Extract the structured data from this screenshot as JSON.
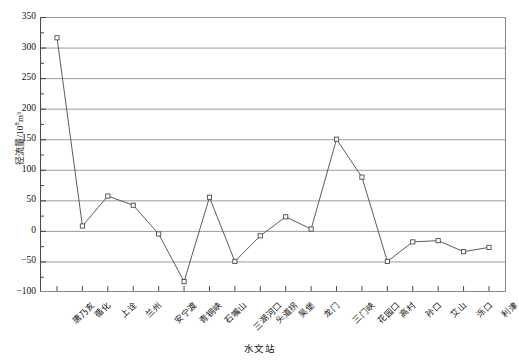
{
  "chart_data": {
    "type": "line",
    "title": "",
    "xlabel": "水文站",
    "ylabel": "径流量/10⁸m³",
    "ylabel_base": "径流量/10",
    "ylabel_exp": "8",
    "ylabel_unit": "m³",
    "ylim": [
      -100,
      350
    ],
    "ytick_step": 50,
    "yticks": [
      350,
      300,
      250,
      200,
      150,
      100,
      50,
      0,
      -50,
      -100
    ],
    "ytick_labels": [
      "350",
      "300",
      "250",
      "200",
      "150",
      "100",
      "50",
      "0",
      "−50",
      "−100"
    ],
    "minor_tick_step": 25,
    "grid": true,
    "grid_axis": "y",
    "legend": "none",
    "marker": "open-square",
    "line_color": "#4a4a4a",
    "marker_color": "#4a4a4a",
    "grid_color": "#8f8f8f",
    "axis_color": "#4a4a4a",
    "categories": [
      "唐乃亥",
      "循化",
      "上诠",
      "兰州",
      "安宁渡",
      "青铜峡",
      "石嘴山",
      "三湖河口",
      "头道拐",
      "吴堡",
      "龙门",
      "三门峡",
      "花园口",
      "高村",
      "孙口",
      "艾山",
      "泺口",
      "利津"
    ],
    "values": [
      316,
      8,
      57,
      42,
      -5,
      -83,
      55,
      -50,
      -8,
      23,
      3,
      150,
      88,
      -50,
      -18,
      -16,
      -34,
      -27
    ],
    "series": [
      {
        "name": "径流量",
        "values": [
          316,
          8,
          57,
          42,
          -5,
          -83,
          55,
          -50,
          -8,
          23,
          3,
          150,
          88,
          -50,
          -18,
          -16,
          -34,
          -27
        ]
      }
    ]
  }
}
